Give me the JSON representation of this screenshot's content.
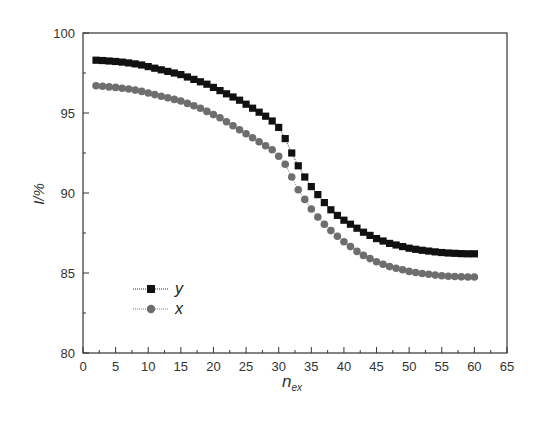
{
  "chart_data": {
    "type": "scatter",
    "title": "",
    "xlabel": "n_ex",
    "xlabel_main": "n",
    "xlabel_sub": "ex",
    "ylabel": "I/%",
    "xlim": [
      0,
      65
    ],
    "ylim": [
      80,
      100
    ],
    "xticks": [
      0,
      5,
      10,
      15,
      20,
      25,
      30,
      35,
      40,
      45,
      50,
      55,
      60,
      65
    ],
    "yticks": [
      80,
      85,
      90,
      95,
      100
    ],
    "grid": false,
    "legend_position": "lower left (inside)",
    "x": [
      2,
      3,
      4,
      5,
      6,
      7,
      8,
      9,
      10,
      11,
      12,
      13,
      14,
      15,
      16,
      17,
      18,
      19,
      20,
      21,
      22,
      23,
      24,
      25,
      26,
      27,
      28,
      29,
      30,
      31,
      32,
      33,
      34,
      35,
      36,
      37,
      38,
      39,
      40,
      41,
      42,
      43,
      44,
      45,
      46,
      47,
      48,
      49,
      50,
      51,
      52,
      53,
      54,
      55,
      56,
      57,
      58,
      59,
      60
    ],
    "series": [
      {
        "name": "y",
        "marker": "square",
        "color": "#111111",
        "values": [
          98.3,
          98.28,
          98.25,
          98.22,
          98.18,
          98.13,
          98.07,
          98.0,
          97.9,
          97.8,
          97.7,
          97.6,
          97.5,
          97.4,
          97.25,
          97.1,
          96.95,
          96.8,
          96.6,
          96.4,
          96.2,
          96.0,
          95.8,
          95.55,
          95.3,
          95.05,
          94.8,
          94.5,
          94.1,
          93.4,
          92.5,
          91.7,
          91.0,
          90.4,
          89.9,
          89.4,
          88.95,
          88.6,
          88.3,
          88.05,
          87.8,
          87.55,
          87.35,
          87.15,
          87.0,
          86.85,
          86.75,
          86.65,
          86.55,
          86.48,
          86.42,
          86.37,
          86.32,
          86.28,
          86.25,
          86.23,
          86.21,
          86.2,
          86.2
        ]
      },
      {
        "name": "x",
        "marker": "circle",
        "color": "#6e6e6e",
        "values": [
          96.7,
          96.67,
          96.63,
          96.6,
          96.55,
          96.5,
          96.43,
          96.35,
          96.25,
          96.15,
          96.05,
          95.95,
          95.85,
          95.75,
          95.6,
          95.45,
          95.3,
          95.1,
          94.9,
          94.7,
          94.45,
          94.2,
          93.95,
          93.7,
          93.45,
          93.2,
          92.95,
          92.7,
          92.3,
          91.8,
          91.0,
          90.2,
          89.6,
          89.0,
          88.5,
          88.05,
          87.65,
          87.3,
          86.95,
          86.65,
          86.35,
          86.1,
          85.9,
          85.7,
          85.55,
          85.4,
          85.3,
          85.2,
          85.1,
          85.03,
          84.97,
          84.92,
          84.87,
          84.83,
          84.8,
          84.78,
          84.76,
          84.75,
          84.75
        ]
      }
    ]
  }
}
